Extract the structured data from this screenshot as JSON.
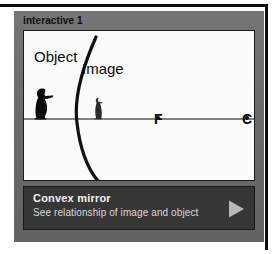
{
  "module": {
    "title": "interactive 1"
  },
  "diagram": {
    "labels": {
      "object": "Object",
      "image": "Image",
      "focal_point": "F",
      "center_of_curvature": "C"
    },
    "icons": {
      "object_figure": "penguin-silhouette-icon",
      "image_figure": "penguin-silhouette-small-icon",
      "mirror": "convex-mirror-arc",
      "axis": "principal-axis-line"
    },
    "geometry": {
      "axis_y": 88,
      "mirror_vertex_x": 53,
      "focal_point_x": 134,
      "center_point_x": 223,
      "object_height_px": 32,
      "image_height_px": 21
    },
    "colors": {
      "stage_background": "#fbfbfb",
      "ink": "#0a0a0a",
      "panel": "#6e6e6e",
      "caption_bar": "#363636",
      "caption_title": "#f2f2f2",
      "caption_subtitle": "#d9d9d9",
      "play_triangle": "#b8b8b8"
    }
  },
  "caption": {
    "title": "Convex mirror",
    "subtitle": "See relationship of image and object",
    "play_icon": "play-triangle-icon"
  }
}
